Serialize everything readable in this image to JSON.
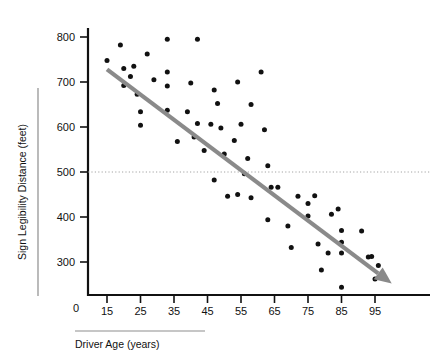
{
  "chart_data": {
    "type": "scatter",
    "title": "",
    "xlabel": "Driver Age (years)",
    "ylabel": "Sign Legibility Distance (feet)",
    "xlim": [
      10,
      102
    ],
    "ylim": [
      215,
      820
    ],
    "xticks": [
      15,
      25,
      35,
      45,
      55,
      65,
      75,
      85,
      95
    ],
    "xtick_labels": [
      "15",
      "25",
      "35",
      "45",
      "55",
      "65",
      "75",
      "85",
      "95"
    ],
    "yticks": [
      300,
      400,
      500,
      600,
      700,
      800
    ],
    "ytick_labels": [
      "300",
      "400",
      "500",
      "600",
      "700",
      "800"
    ],
    "origin_label": "0",
    "grid": false,
    "legend": null,
    "reference_lines": [
      {
        "name": "500-feet-reference",
        "axis": "y",
        "value": 500,
        "style": "dotted",
        "color": "#9a9a9a"
      }
    ],
    "trend_line": {
      "name": "downward-trend-arrow",
      "style": "solid-arrow",
      "color": "#8a8a8a",
      "x_start": 15,
      "y_start": 728,
      "x_end": 100,
      "y_end": 252
    },
    "point_color": "#111111",
    "points": [
      {
        "x": 15,
        "y": 748
      },
      {
        "x": 19,
        "y": 782
      },
      {
        "x": 20,
        "y": 730
      },
      {
        "x": 20,
        "y": 692
      },
      {
        "x": 22,
        "y": 712
      },
      {
        "x": 23,
        "y": 735
      },
      {
        "x": 24,
        "y": 673
      },
      {
        "x": 25,
        "y": 634
      },
      {
        "x": 25,
        "y": 604
      },
      {
        "x": 27,
        "y": 762
      },
      {
        "x": 29,
        "y": 705
      },
      {
        "x": 33,
        "y": 795
      },
      {
        "x": 33,
        "y": 722
      },
      {
        "x": 33,
        "y": 691
      },
      {
        "x": 33,
        "y": 637
      },
      {
        "x": 36,
        "y": 568
      },
      {
        "x": 39,
        "y": 634
      },
      {
        "x": 40,
        "y": 698
      },
      {
        "x": 41,
        "y": 578
      },
      {
        "x": 42,
        "y": 795
      },
      {
        "x": 42,
        "y": 608
      },
      {
        "x": 44,
        "y": 548
      },
      {
        "x": 46,
        "y": 606
      },
      {
        "x": 47,
        "y": 682
      },
      {
        "x": 47,
        "y": 482
      },
      {
        "x": 48,
        "y": 652
      },
      {
        "x": 49,
        "y": 598
      },
      {
        "x": 50,
        "y": 540
      },
      {
        "x": 51,
        "y": 446
      },
      {
        "x": 53,
        "y": 570
      },
      {
        "x": 54,
        "y": 700
      },
      {
        "x": 54,
        "y": 450
      },
      {
        "x": 55,
        "y": 606
      },
      {
        "x": 56,
        "y": 496
      },
      {
        "x": 57,
        "y": 530
      },
      {
        "x": 58,
        "y": 650
      },
      {
        "x": 58,
        "y": 443
      },
      {
        "x": 61,
        "y": 722
      },
      {
        "x": 62,
        "y": 594
      },
      {
        "x": 63,
        "y": 514
      },
      {
        "x": 63,
        "y": 394
      },
      {
        "x": 64,
        "y": 466
      },
      {
        "x": 66,
        "y": 466
      },
      {
        "x": 69,
        "y": 380
      },
      {
        "x": 70,
        "y": 332
      },
      {
        "x": 72,
        "y": 446
      },
      {
        "x": 75,
        "y": 430
      },
      {
        "x": 75,
        "y": 402
      },
      {
        "x": 77,
        "y": 447
      },
      {
        "x": 78,
        "y": 340
      },
      {
        "x": 79,
        "y": 282
      },
      {
        "x": 81,
        "y": 320
      },
      {
        "x": 82,
        "y": 406
      },
      {
        "x": 84,
        "y": 418
      },
      {
        "x": 85,
        "y": 370
      },
      {
        "x": 85,
        "y": 344
      },
      {
        "x": 85,
        "y": 320
      },
      {
        "x": 85,
        "y": 244
      },
      {
        "x": 91,
        "y": 369
      },
      {
        "x": 93,
        "y": 311
      },
      {
        "x": 94,
        "y": 312
      },
      {
        "x": 95,
        "y": 262
      },
      {
        "x": 96,
        "y": 292
      }
    ]
  },
  "axis_decorations": {
    "y_label_rule": "vertical-rule-left-of-ylabel",
    "x_label_rule": "horizontal-rule-above-xlabel"
  }
}
